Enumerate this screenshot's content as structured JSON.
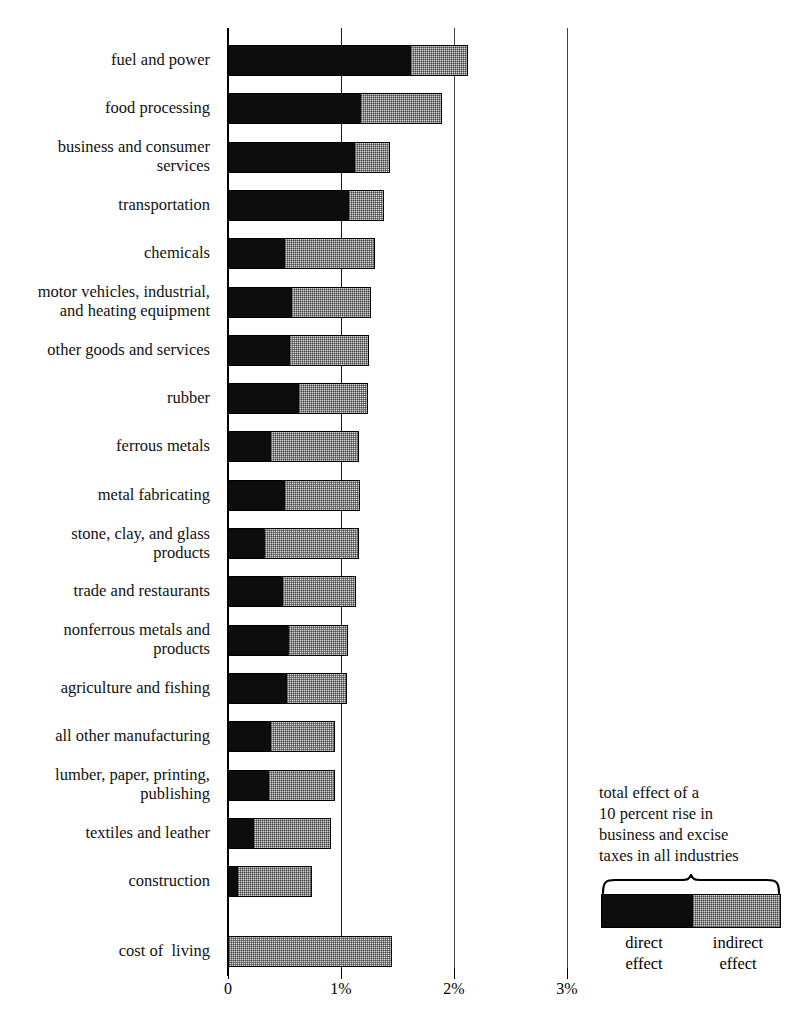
{
  "chart_data": {
    "type": "bar",
    "orientation": "horizontal",
    "stacked": true,
    "title": "",
    "subtitle": "",
    "xlabel": "",
    "ylabel": "",
    "xlim": [
      0,
      3.2
    ],
    "grid": true,
    "legend_position": "bottom-right",
    "axis_ticks": [
      {
        "label": "0",
        "value": 0
      },
      {
        "label": "1%",
        "value": 1
      },
      {
        "label": "2%",
        "value": 2
      },
      {
        "label": "3%",
        "value": 3
      }
    ],
    "categories": [
      "fuel and power",
      "food processing",
      "business and consumer services",
      "transportation",
      "chemicals",
      "motor vehicles, industrial, and heating equipment",
      "other goods and services",
      "rubber",
      "ferrous metals",
      "metal fabricating",
      "stone, clay, and glass products",
      "trade and restaurants",
      "nonferrous metals and products",
      "agriculture and fishing",
      "all other manufacturing",
      "lumber, paper, printing, publishing",
      "textiles and leather",
      "construction",
      "cost of  living"
    ],
    "series": [
      {
        "name": "direct effect",
        "color": "#0d0d0d",
        "values": [
          1.62,
          1.18,
          1.12,
          1.07,
          0.5,
          0.57,
          0.55,
          0.63,
          0.38,
          0.5,
          0.33,
          0.49,
          0.54,
          0.52,
          0.38,
          0.36,
          0.23,
          0.09,
          0.0
        ]
      },
      {
        "name": "indirect effect",
        "color": "#d6d6d6",
        "values": [
          0.51,
          0.72,
          0.32,
          0.32,
          0.81,
          0.7,
          0.71,
          0.62,
          0.79,
          0.68,
          0.84,
          0.65,
          0.53,
          0.54,
          0.58,
          0.6,
          0.69,
          0.66,
          1.45
        ]
      }
    ],
    "totals": [
      2.13,
      1.9,
      1.44,
      1.39,
      1.31,
      1.27,
      1.26,
      1.25,
      1.17,
      1.18,
      1.17,
      1.14,
      1.07,
      1.06,
      0.96,
      0.96,
      0.92,
      0.75,
      1.45
    ]
  },
  "rows": [
    {
      "label_lines": [
        "fuel and power"
      ]
    },
    {
      "label_lines": [
        "food processing"
      ]
    },
    {
      "label_lines": [
        "business and consumer",
        "services"
      ]
    },
    {
      "label_lines": [
        "transportation"
      ]
    },
    {
      "label_lines": [
        "chemicals"
      ]
    },
    {
      "label_lines": [
        "motor vehicles, industrial,",
        "and heating equipment"
      ]
    },
    {
      "label_lines": [
        "other goods and services"
      ]
    },
    {
      "label_lines": [
        "rubber"
      ]
    },
    {
      "label_lines": [
        "ferrous metals"
      ]
    },
    {
      "label_lines": [
        "metal fabricating"
      ]
    },
    {
      "label_lines": [
        "stone, clay, and glass",
        "products"
      ]
    },
    {
      "label_lines": [
        "trade and restaurants"
      ]
    },
    {
      "label_lines": [
        "nonferrous metals and",
        "products"
      ]
    },
    {
      "label_lines": [
        "agriculture and fishing"
      ]
    },
    {
      "label_lines": [
        "all other manufacturing"
      ]
    },
    {
      "label_lines": [
        "lumber, paper, printing,",
        "publishing"
      ]
    },
    {
      "label_lines": [
        "textiles and leather"
      ]
    },
    {
      "label_lines": [
        "construction"
      ]
    },
    {
      "label_lines": [
        "cost of  living"
      ]
    }
  ],
  "legend": {
    "caption_lines": [
      "total effect of a",
      "10 percent rise in",
      "business and excise",
      "taxes in all industries"
    ],
    "direct_label_lines": [
      "direct",
      "effect"
    ],
    "indirect_label_lines": [
      "indirect",
      "effect"
    ],
    "direct_color": "#0d0d0d",
    "indirect_color": "#d6d6d6"
  },
  "colors": {
    "ink": "#000000",
    "direct": "#0d0d0d",
    "indirect": "#d6d6d6",
    "background": "#ffffff"
  }
}
